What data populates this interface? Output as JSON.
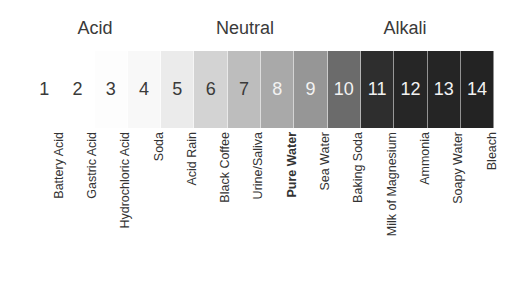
{
  "groups": [
    {
      "label": "Acid",
      "center_x": 95
    },
    {
      "label": "Neutral",
      "center_x": 245
    },
    {
      "label": "Alkali",
      "center_x": 405
    }
  ],
  "scale": [
    {
      "ph": "1",
      "label": "Battery Acid",
      "bg": "#ffffff",
      "fg": "#3a3a3a",
      "bold": false
    },
    {
      "ph": "2",
      "label": "Gastric Acid",
      "bg": "#ffffff",
      "fg": "#3a3a3a",
      "bold": false
    },
    {
      "ph": "3",
      "label": "Hydrochloric Acid",
      "bg": "#fdfdfd",
      "fg": "#3a3a3a",
      "bold": false
    },
    {
      "ph": "4",
      "label": "Soda",
      "bg": "#f8f8f8",
      "fg": "#3a3a3a",
      "bold": false
    },
    {
      "ph": "5",
      "label": "Acid Rain",
      "bg": "#ebebeb",
      "fg": "#3a3a3a",
      "bold": false
    },
    {
      "ph": "6",
      "label": "Black Coffee",
      "bg": "#d3d3d3",
      "fg": "#3a3a3a",
      "bold": false
    },
    {
      "ph": "7",
      "label": "Urine/Saliva",
      "bg": "#bdbdbd",
      "fg": "#3a3a3a",
      "bold": false
    },
    {
      "ph": "8",
      "label": "Pure Water",
      "bg": "#a9a9a9",
      "fg": "#f2f2f2",
      "bold": true
    },
    {
      "ph": "9",
      "label": "Sea Water",
      "bg": "#969696",
      "fg": "#f2f2f2",
      "bold": false
    },
    {
      "ph": "10",
      "label": "Baking Soda",
      "bg": "#6b6b6b",
      "fg": "#f2f2f2",
      "bold": false
    },
    {
      "ph": "11",
      "label": "Milk of Magnesium",
      "bg": "#2e2e2e",
      "fg": "#f2f2f2",
      "bold": false
    },
    {
      "ph": "12",
      "label": "Ammonia",
      "bg": "#262626",
      "fg": "#f2f2f2",
      "bold": false
    },
    {
      "ph": "13",
      "label": "Soapy Water",
      "bg": "#252525",
      "fg": "#f2f2f2",
      "bold": false
    },
    {
      "ph": "14",
      "label": "Bleach",
      "bg": "#232323",
      "fg": "#f2f2f2",
      "bold": false
    }
  ],
  "extra_label": "Drain Cleaner"
}
